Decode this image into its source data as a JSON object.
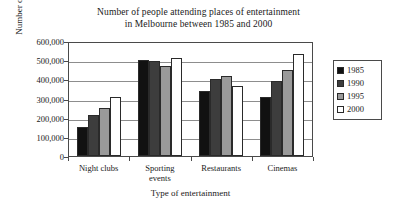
{
  "chart_data": {
    "type": "bar",
    "title": "Number of people attending places of entertainment in Melbourne between 1985 and 2000",
    "title_lines": [
      "Number of people attending places of entertainment",
      "in Melbourne between 1985 and 2000"
    ],
    "xlabel": "Type of entertainment",
    "ylabel": "Number of people",
    "categories": [
      "Night clubs",
      "Sporting events",
      "Restaurants",
      "Cinemas"
    ],
    "category_lines": [
      [
        "Night clubs"
      ],
      [
        "Sporting",
        "events"
      ],
      [
        "Restaurants"
      ],
      [
        "Cinemas"
      ]
    ],
    "series": [
      {
        "name": "1985",
        "color": "#111111",
        "values": [
          150000,
          500000,
          340000,
          310000
        ]
      },
      {
        "name": "1990",
        "color": "#3d3d3d",
        "values": [
          215000,
          495000,
          400000,
          390000
        ]
      },
      {
        "name": "1995",
        "color": "#9a9a9a",
        "values": [
          250000,
          470000,
          420000,
          450000
        ]
      },
      {
        "name": "2000",
        "color": "#ffffff",
        "values": [
          310000,
          510000,
          365000,
          530000
        ]
      }
    ],
    "ylim": [
      0,
      600000
    ],
    "ytick_values": [
      600000,
      500000,
      400000,
      300000,
      200000,
      100000,
      0
    ],
    "ytick_labels": [
      "600,000",
      "500,000",
      "400,000",
      "300,000",
      "200,000",
      "100,000",
      "0"
    ],
    "grid": true,
    "grid_axis": "y",
    "legend_position": "right-outside",
    "legend_entries": [
      {
        "label": "1985",
        "color": "#111111"
      },
      {
        "label": "1990",
        "color": "#3d3d3d"
      },
      {
        "label": "1995",
        "color": "#9a9a9a"
      },
      {
        "label": "2000",
        "color": "#ffffff"
      }
    ]
  }
}
